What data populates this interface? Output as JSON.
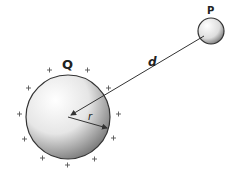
{
  "diagram": {
    "labels": {
      "sphere_q": "Q",
      "sphere_p": "P",
      "distance": "d",
      "radius": "r"
    },
    "charge_sign": "+",
    "colors": {
      "stroke": "#333333",
      "shade": "#555555",
      "background": "#ffffff"
    }
  }
}
